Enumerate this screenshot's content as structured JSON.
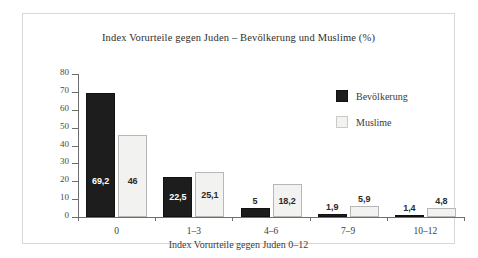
{
  "figure": {
    "title": "Index Vorurteile gegen Juden – Bevölkerung und Muslime (%)",
    "x_axis_title": "Index Vorurteile gegen Juden 0–12"
  },
  "legend": {
    "position": "top-right",
    "entries": [
      {
        "label": "Bevölkerung",
        "swatch": "dark-square-icon",
        "color": "#1d1d1d"
      },
      {
        "label": "Muslime",
        "swatch": "light-square-icon",
        "color": "#f2f2f0"
      }
    ]
  },
  "axes": {
    "y_ticks": [
      "0",
      "10",
      "20",
      "30",
      "40",
      "50",
      "60",
      "70",
      "80"
    ],
    "x_ticks": [
      "0",
      "1–3",
      "4–6",
      "7–9",
      "10–12"
    ]
  },
  "chart_data": {
    "type": "bar",
    "title": "Index Vorurteile gegen Juden – Bevölkerung und Muslime (%)",
    "xlabel": "Index Vorurteile gegen Juden 0–12",
    "ylabel": "",
    "ylim": [
      0,
      80
    ],
    "yticks": [
      0,
      10,
      20,
      30,
      40,
      50,
      60,
      70,
      80
    ],
    "grid": false,
    "legend_position": "top-right",
    "categories": [
      "0",
      "1–3",
      "4–6",
      "7–9",
      "10–12"
    ],
    "series": [
      {
        "name": "Bevölkerung",
        "color": "#1d1d1d",
        "values": [
          69.2,
          22.5,
          5,
          1.9,
          1.4
        ],
        "labels": [
          "69,2",
          "22,5",
          "5",
          "1,9",
          "1,4"
        ]
      },
      {
        "name": "Muslime",
        "color": "#f2f2f0",
        "values": [
          46,
          25.1,
          18.2,
          5.9,
          4.8
        ],
        "labels": [
          "46",
          "25,1",
          "18,2",
          "5,9",
          "4,8"
        ]
      }
    ]
  }
}
